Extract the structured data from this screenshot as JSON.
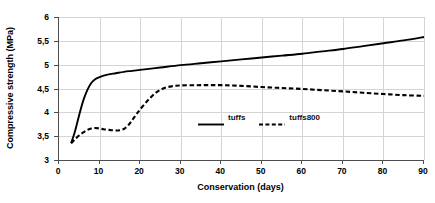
{
  "chart_data": {
    "type": "line",
    "title": "",
    "xlabel": "Conservation (days)",
    "ylabel": "Compressive strength (MPa)",
    "xlim": [
      0,
      90
    ],
    "ylim": [
      3,
      6
    ],
    "grid": true,
    "legend_position": "center",
    "x_ticks": [
      "0",
      "10",
      "20",
      "30",
      "40",
      "50",
      "60",
      "70",
      "80",
      "90"
    ],
    "x_tick_values": [
      0,
      10,
      20,
      30,
      40,
      50,
      60,
      70,
      80,
      90
    ],
    "y_ticks": [
      "3",
      "3,5",
      "4",
      "4,5",
      "5",
      "5,5",
      "6"
    ],
    "y_tick_values": [
      3,
      3.5,
      4,
      4.5,
      5,
      5.5,
      6
    ],
    "series": [
      {
        "name": "tuffs",
        "style": "solid",
        "color": "#000000",
        "x": [
          3,
          4,
          5,
          6,
          7,
          8,
          9,
          10,
          12,
          14,
          16,
          18,
          20,
          25,
          30,
          35,
          40,
          45,
          50,
          55,
          60,
          65,
          70,
          75,
          80,
          85,
          90
        ],
        "values": [
          3.35,
          3.62,
          3.95,
          4.25,
          4.47,
          4.62,
          4.7,
          4.74,
          4.79,
          4.82,
          4.85,
          4.87,
          4.89,
          4.94,
          4.99,
          5.03,
          5.07,
          5.11,
          5.15,
          5.19,
          5.23,
          5.28,
          5.33,
          5.39,
          5.45,
          5.51,
          5.58
        ]
      },
      {
        "name": "tuffs800",
        "style": "dashed",
        "color": "#000000",
        "x": [
          3,
          4,
          5,
          6,
          7,
          8,
          9,
          10,
          11,
          12,
          13,
          14,
          15,
          16,
          17,
          18,
          19,
          20,
          22,
          24,
          26,
          28,
          30,
          35,
          40,
          45,
          50,
          55,
          60,
          65,
          70,
          75,
          80,
          85,
          90
        ],
        "values": [
          3.35,
          3.44,
          3.52,
          3.58,
          3.63,
          3.66,
          3.67,
          3.66,
          3.645,
          3.635,
          3.625,
          3.62,
          3.625,
          3.65,
          3.72,
          3.83,
          3.95,
          4.06,
          4.26,
          4.42,
          4.51,
          4.55,
          4.565,
          4.57,
          4.57,
          4.555,
          4.53,
          4.51,
          4.49,
          4.465,
          4.44,
          4.41,
          4.385,
          4.36,
          4.345
        ]
      }
    ]
  },
  "legend": {
    "entries": [
      {
        "label": "tuffs",
        "style": "solid"
      },
      {
        "label": "tuffs800",
        "style": "dashed"
      }
    ]
  }
}
